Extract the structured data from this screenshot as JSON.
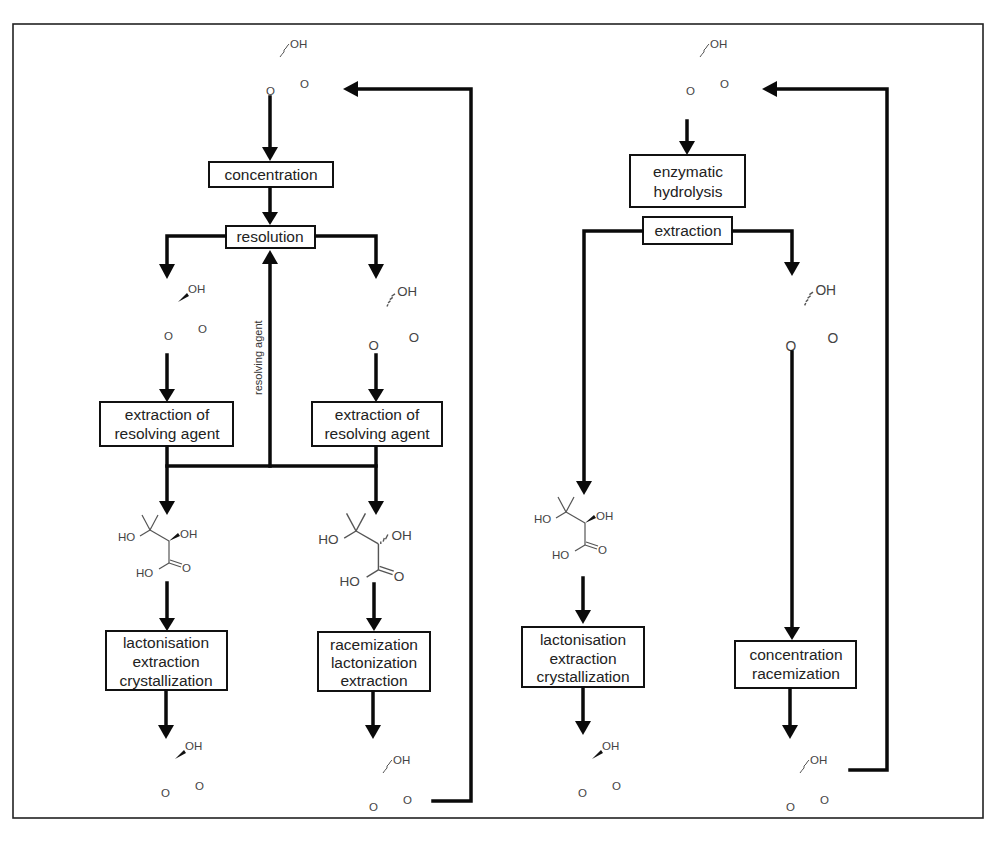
{
  "figure": {
    "frame": {
      "stroke": "#222222",
      "background": "#ffffff"
    },
    "top_cut_text": "",
    "bottom_cut_text": ""
  },
  "left_scheme": {
    "start_molecule": {
      "name": "racemic pantolactone",
      "substituent": "OH",
      "stereo": "wavy",
      "carbonyl": "O",
      "ring_oxygen": "O"
    },
    "steps": {
      "concentration": "concentration",
      "resolution": "resolution",
      "resolving_agent_label": "resolving agent",
      "extraction_left_line1": "extraction of",
      "extraction_left_line2": "resolving agent",
      "extraction_right_line1": "extraction of",
      "extraction_right_line2": "resolving agent",
      "lact_left_line1": "lactonisation",
      "lact_left_line2": "extraction",
      "lact_left_line3": "crystallization",
      "race_right_line1": "racemization",
      "race_right_line2": "lactonization",
      "race_right_line3": "extraction"
    },
    "molecules": {
      "resolved_left": {
        "substituent": "OH",
        "stereo": "wedge",
        "carbonyl": "O",
        "ring_oxygen": "O"
      },
      "resolved_right": {
        "substituent": "OH",
        "stereo": "hash",
        "carbonyl": "O",
        "ring_oxygen": "O"
      },
      "acid_left": {
        "ho_tert": "HO",
        "oh": "OH",
        "stereo": "wedge",
        "acid_ho": "HO",
        "carbonyl": "O"
      },
      "acid_right": {
        "ho_tert": "HO",
        "oh": "OH",
        "stereo": "hash",
        "acid_ho": "HO",
        "carbonyl": "O"
      },
      "product_left": {
        "substituent": "OH",
        "stereo": "wedge",
        "carbonyl": "O",
        "ring_oxygen": "O"
      },
      "recycled_right": {
        "substituent": "OH",
        "stereo": "wavy",
        "carbonyl": "O",
        "ring_oxygen": "O"
      }
    }
  },
  "right_scheme": {
    "start_molecule": {
      "name": "racemic pantolactone",
      "substituent": "OH",
      "stereo": "wavy",
      "carbonyl": "O",
      "ring_oxygen": "O"
    },
    "steps": {
      "enzymatic_line1": "enzymatic",
      "enzymatic_line2": "hydrolysis",
      "extraction": "extraction",
      "lact_line1": "lactonisation",
      "lact_line2": "extraction",
      "lact_line3": "crystallization",
      "conc_line1": "concentration",
      "conc_line2": "racemization"
    },
    "molecules": {
      "lactone_right": {
        "substituent": "OH",
        "stereo": "hash",
        "carbonyl": "O",
        "ring_oxygen": "O"
      },
      "acid_left": {
        "ho_tert": "HO",
        "oh": "OH",
        "stereo": "wedge",
        "acid_ho": "HO",
        "carbonyl": "O"
      },
      "product_left": {
        "substituent": "OH",
        "stereo": "wedge",
        "carbonyl": "O",
        "ring_oxygen": "O"
      },
      "recycled_right": {
        "substituent": "OH",
        "stereo": "wavy",
        "carbonyl": "O",
        "ring_oxygen": "O"
      }
    }
  }
}
